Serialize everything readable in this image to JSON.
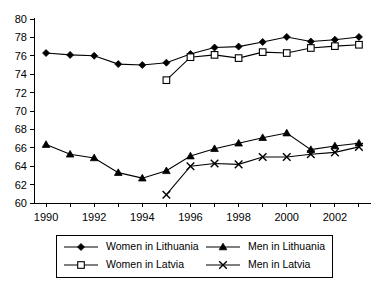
{
  "chart_data": {
    "type": "line",
    "title": "",
    "subtitle": "",
    "xlabel": "",
    "ylabel": "",
    "xlim": [
      1989.5,
      2003.5
    ],
    "ylim": [
      60,
      80
    ],
    "grid": false,
    "legend_position": "bottom",
    "y_ticks": [
      60,
      62,
      64,
      66,
      68,
      70,
      72,
      74,
      76,
      78,
      80
    ],
    "x_ticks": [
      1990,
      1991,
      1992,
      1993,
      1994,
      1995,
      1996,
      1997,
      1998,
      1999,
      2000,
      2001,
      2002,
      2003
    ],
    "x_tick_labels": [
      "1990",
      "",
      "1992",
      "",
      "1994",
      "",
      "1996",
      "",
      "1998",
      "",
      "2000",
      "",
      "2002",
      ""
    ],
    "x_tick_labels_shown": [
      "1990",
      "1992",
      "1994",
      "1996",
      "1998",
      "2000",
      "2002"
    ],
    "series": [
      {
        "name": "Women in Lithuania",
        "marker": "filled-diamond",
        "line_style": "solid",
        "color": "#000000",
        "x": [
          1990,
          1991,
          1992,
          1993,
          1994,
          1995,
          1996,
          1997,
          1998,
          1999,
          2000,
          2001,
          2002,
          2003
        ],
        "values": [
          76.3,
          76.1,
          76.0,
          75.1,
          75.0,
          75.25,
          76.2,
          76.9,
          77.0,
          77.5,
          78.05,
          77.55,
          77.75,
          78.05
        ]
      },
      {
        "name": "Men in Lithuania",
        "marker": "filled-triangle",
        "line_style": "solid",
        "color": "#000000",
        "x": [
          1990,
          1991,
          1992,
          1993,
          1994,
          1995,
          1996,
          1997,
          1998,
          1999,
          2000,
          2001,
          2002,
          2003
        ],
        "values": [
          66.35,
          65.3,
          64.9,
          63.3,
          62.7,
          63.5,
          65.1,
          65.9,
          66.5,
          67.1,
          67.6,
          65.8,
          66.2,
          66.5
        ]
      },
      {
        "name": "Women in Latvia",
        "marker": "open-square",
        "line_style": "solid",
        "color": "#000000",
        "x": [
          1995,
          1996,
          1997,
          1998,
          1999,
          2000,
          2001,
          2002,
          2003
        ],
        "values": [
          73.35,
          75.85,
          76.1,
          75.75,
          76.4,
          76.3,
          76.85,
          77.05,
          77.2
        ]
      },
      {
        "name": "Men in Latvia",
        "marker": "x-cross",
        "line_style": "solid",
        "color": "#000000",
        "x": [
          1995,
          1996,
          1997,
          1998,
          1999,
          2000,
          2001,
          2002,
          2003
        ],
        "values": [
          60.9,
          64.0,
          64.3,
          64.2,
          65.0,
          65.0,
          65.3,
          65.5,
          66.1
        ]
      }
    ]
  },
  "legend": {
    "entries": [
      {
        "label": "Women in Lithuania",
        "marker": "filled-diamond"
      },
      {
        "label": "Men in Lithuania",
        "marker": "filled-triangle"
      },
      {
        "label": "Women in Latvia",
        "marker": "open-square"
      },
      {
        "label": "Men in Latvia",
        "marker": "x-cross"
      }
    ]
  },
  "axes": {
    "y_min_label": "60",
    "y_max_label": "80"
  }
}
